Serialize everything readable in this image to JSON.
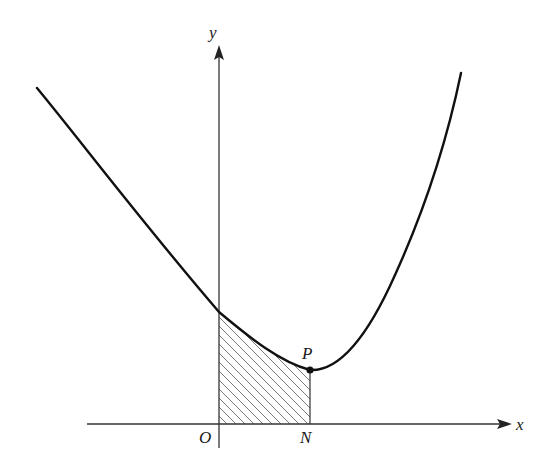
{
  "figure": {
    "labels": {
      "y_axis": "y",
      "x_axis": "x",
      "origin": "O",
      "point_p": "P",
      "point_n": "N"
    },
    "colors": {
      "curve": "#111111",
      "axis": "#333333",
      "hatch": "#6a6a6a",
      "background": "#ffffff"
    }
  }
}
